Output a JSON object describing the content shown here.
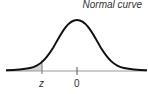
{
  "diagram": {
    "title": "Normal curve",
    "labels": {
      "z": "z",
      "zero": "0"
    },
    "shading": {
      "region": "left tail up to z",
      "color": "#d4d4d4"
    },
    "curve_color": "#111111",
    "axis_color": "#999999"
  }
}
